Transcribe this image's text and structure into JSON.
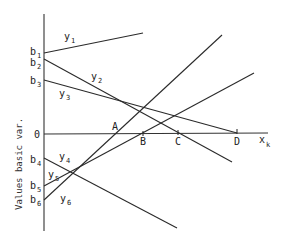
{
  "diagram": {
    "y_axis_label": "Values basic var.",
    "x_axis_label": {
      "base": "x",
      "sub": "k"
    },
    "zero_label": "0",
    "intercepts": [
      {
        "id": "b1",
        "base": "b",
        "sub": "1"
      },
      {
        "id": "b2",
        "base": "b",
        "sub": "2"
      },
      {
        "id": "b3",
        "base": "b",
        "sub": "3"
      },
      {
        "id": "b4",
        "base": "b",
        "sub": "4"
      },
      {
        "id": "b5",
        "base": "b",
        "sub": "5"
      },
      {
        "id": "b6",
        "base": "b",
        "sub": "6"
      }
    ],
    "lines": [
      {
        "id": "y1",
        "base": "y",
        "sub": "1"
      },
      {
        "id": "y2",
        "base": "y",
        "sub": "2"
      },
      {
        "id": "y3",
        "base": "y",
        "sub": "3"
      },
      {
        "id": "y4",
        "base": "y",
        "sub": "4"
      },
      {
        "id": "y5",
        "base": "y",
        "sub": "5"
      },
      {
        "id": "y6",
        "base": "y",
        "sub": "6"
      }
    ],
    "points": [
      {
        "id": "A",
        "label": "A"
      },
      {
        "id": "B",
        "label": "B"
      },
      {
        "id": "C",
        "label": "C"
      },
      {
        "id": "D",
        "label": "D"
      }
    ],
    "colors": {
      "ink": "#2a2a2a",
      "background": "#ffffff"
    }
  }
}
